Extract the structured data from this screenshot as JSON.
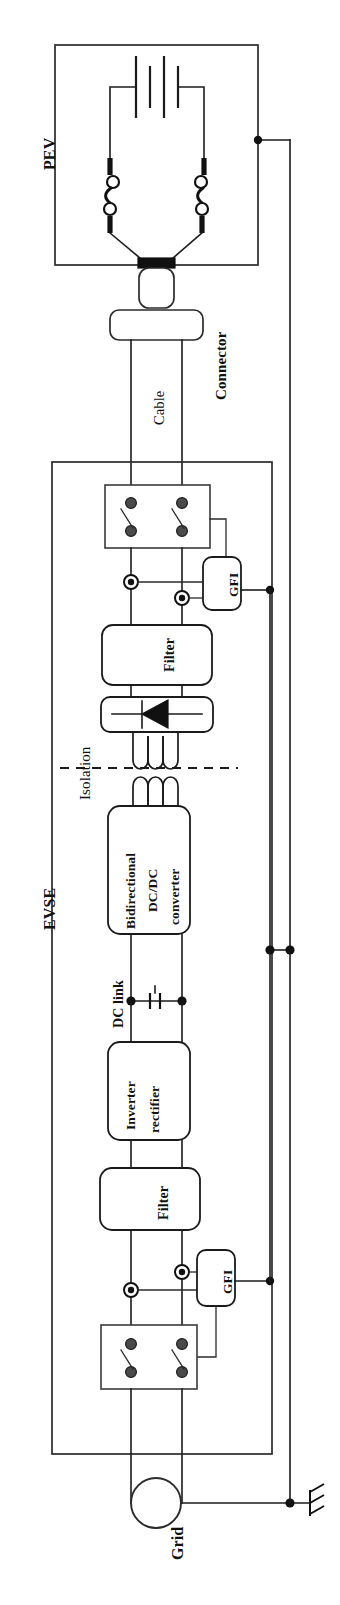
{
  "figure": {
    "orientation": "rotated-90-ccw",
    "width": 340,
    "height": 1605,
    "background": "#ffffff",
    "line_color": "#1b1b1b"
  },
  "enclosures": [
    {
      "id": "pev",
      "label": "PEV"
    },
    {
      "id": "evse",
      "label": "EVSE"
    }
  ],
  "labels": {
    "pev": "PEV",
    "connector": "Connector",
    "cable": "Cable",
    "isolation": "Isolation",
    "evse": "EVSE",
    "dc_link": "DC link",
    "grid": "Grid"
  },
  "blocks": [
    {
      "id": "pev-battery",
      "name": "battery",
      "label": "",
      "symbol": "battery-cell-stack"
    },
    {
      "id": "pev-contactor",
      "name": "pev-contactors",
      "label": "",
      "symbol": "double-pole-relay"
    },
    {
      "id": "connector-plug",
      "name": "connector",
      "label": "Connector",
      "symbol": "plug-and-socket"
    },
    {
      "id": "evse-output-contactor",
      "name": "output-contactor",
      "label": "",
      "symbol": "double-pole-switch"
    },
    {
      "id": "gfi-output",
      "name": "ground-fault-interrupter-output",
      "label": "GFI",
      "symbol": "gfi-module"
    },
    {
      "id": "filter-output",
      "name": "output-filter",
      "label": "Filter",
      "symbol": "filter-block"
    },
    {
      "id": "rectifier-secondary",
      "name": "secondary-rectifier",
      "label": "",
      "symbol": "diode"
    },
    {
      "id": "isolation-transformer",
      "name": "isolation-transformer",
      "label": "Isolation",
      "symbol": "transformer-windings"
    },
    {
      "id": "dcdc-converter",
      "name": "bidirectional-dcdc-converter",
      "label": "Bidirectional DC/DC converter",
      "label_lines": [
        "Bidirectional",
        "DC/DC",
        "converter"
      ],
      "symbol": "converter-block"
    },
    {
      "id": "dc-link-cap",
      "name": "dc-link-capacitor",
      "label": "DC link",
      "symbol": "capacitor"
    },
    {
      "id": "inverter-rectifier",
      "name": "inverter-rectifier",
      "label": "Inverter rectifier",
      "label_lines": [
        "Inverter",
        "rectifier"
      ],
      "symbol": "converter-block"
    },
    {
      "id": "filter-input",
      "name": "input-filter",
      "label": "Filter",
      "symbol": "filter-block"
    },
    {
      "id": "gfi-input",
      "name": "ground-fault-interrupter-input",
      "label": "GFI",
      "symbol": "gfi-module"
    },
    {
      "id": "evse-input-contactor",
      "name": "input-contactor",
      "label": "",
      "symbol": "double-pole-switch"
    },
    {
      "id": "grid-source",
      "name": "grid-source",
      "label": "Grid",
      "symbol": "ac-source-circle"
    },
    {
      "id": "earth-ground",
      "name": "earth-ground",
      "label": "",
      "symbol": "ground"
    }
  ],
  "block_text": {
    "gfi": "GFI",
    "filter": "Filter",
    "dcdc_line1": "Bidirectional",
    "dcdc_line2": "DC/DC",
    "dcdc_line3": "converter",
    "inv_line1": "Inverter",
    "inv_line2": "rectifier"
  },
  "colors": {
    "line": "#1b1b1b",
    "enclosure": "#2b2b2b",
    "fill": "#ffffff",
    "contact": "#4a4a4a",
    "node": "#111111"
  }
}
